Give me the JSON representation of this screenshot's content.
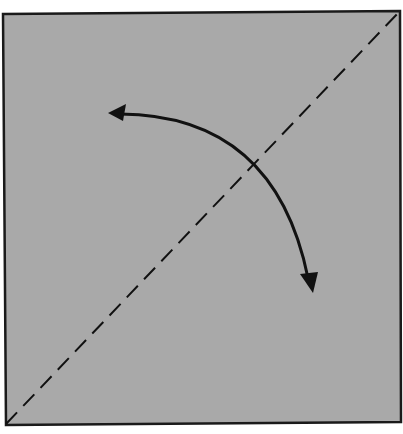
{
  "diagram": {
    "type": "origami-fold-step",
    "colors": {
      "background": "#ffffff",
      "paper": "#a9a9a9",
      "outline": "#1a1a1a",
      "fold_line": "#111111",
      "arrow": "#111111"
    },
    "paper_square": {
      "corners": [
        [
          3,
          14
        ],
        [
          400,
          11
        ],
        [
          401,
          422
        ],
        [
          6,
          425
        ]
      ]
    },
    "fold_line": {
      "style": "dashed",
      "from": [
        6,
        424
      ],
      "to": [
        399,
        12
      ]
    },
    "fold_arrow": {
      "style": "curved-double-arrow",
      "start": [
        108,
        113
      ],
      "end": [
        312,
        292
      ],
      "control": [
        250,
        130
      ]
    }
  }
}
